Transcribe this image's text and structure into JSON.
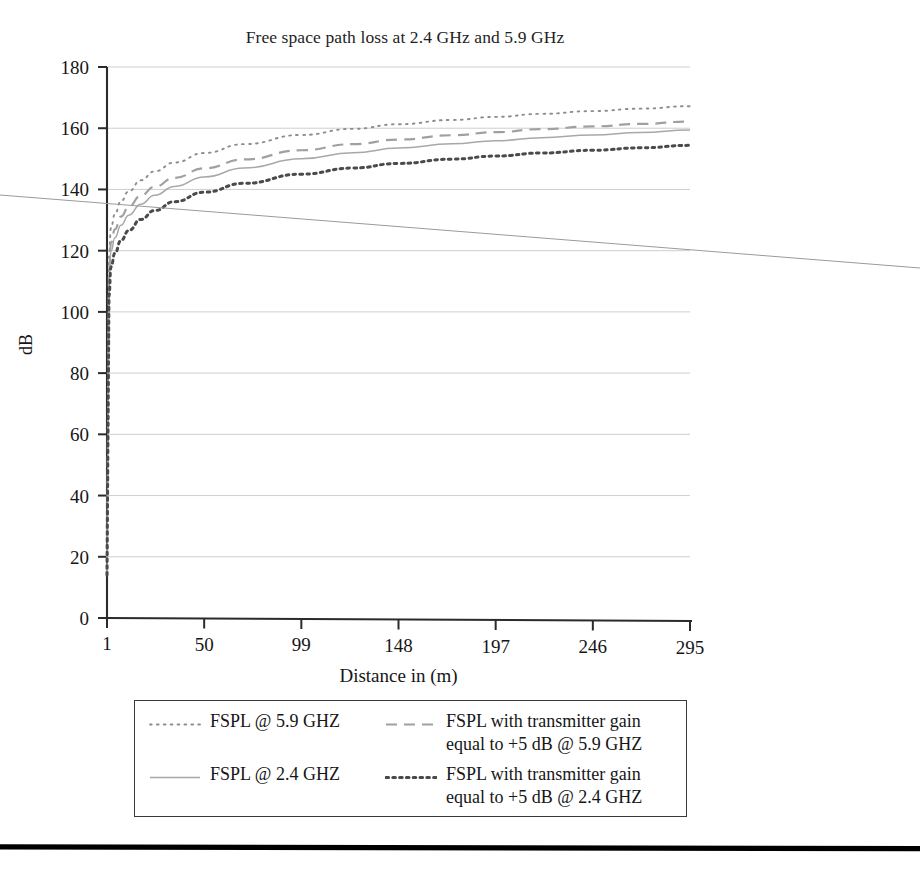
{
  "chart_data": {
    "type": "line",
    "title": "Free space path loss at 2.4 GHz and 5.9 GHz",
    "xlabel": "Distance in (m)",
    "ylabel": "dB",
    "xlim": [
      1,
      295
    ],
    "ylim": [
      0,
      180
    ],
    "grid": true,
    "legend_position": "below-plot",
    "xticks": [
      1,
      50,
      99,
      148,
      197,
      246,
      295
    ],
    "xtick_labels": [
      "1",
      "50",
      "99",
      "148",
      "197",
      "246",
      "295"
    ],
    "yticks": [
      0,
      20,
      40,
      60,
      80,
      100,
      120,
      140,
      160,
      180
    ],
    "ytick_labels": [
      "0",
      "20",
      "40",
      "60",
      "80",
      "100",
      "120",
      "140",
      "160",
      "180"
    ],
    "x": [
      1,
      2,
      3,
      5,
      8,
      12,
      18,
      25,
      35,
      50,
      70,
      99,
      125,
      148,
      175,
      197,
      220,
      246,
      270,
      295
    ],
    "series": [
      {
        "name": "FSPL @ 5.9 GHZ",
        "dash": "dotted",
        "color": "#8d8d8d",
        "values": [
          14.0,
          118.0,
          127.5,
          132.0,
          136.1,
          139.4,
          143.0,
          145.9,
          148.8,
          151.9,
          154.8,
          157.8,
          159.8,
          161.3,
          162.7,
          163.7,
          164.7,
          165.6,
          166.4,
          167.2
        ]
      },
      {
        "name": "FSPL with transmitter gain equal to +5 dB @ 5.9 GHZ",
        "dash": "dashed",
        "color": "#a0a0a0",
        "values": [
          14.0,
          113.0,
          122.5,
          127.0,
          131.1,
          134.4,
          138.0,
          140.9,
          143.8,
          146.9,
          149.8,
          152.8,
          154.8,
          156.3,
          157.7,
          158.7,
          159.7,
          160.6,
          161.4,
          162.2
        ]
      },
      {
        "name": "FSPL @ 2.4 GHZ",
        "dash": "solid",
        "color": "#a8a8a8",
        "values": [
          14.0,
          110.2,
          119.7,
          124.2,
          128.3,
          131.6,
          135.2,
          138.1,
          141.0,
          144.1,
          147.0,
          150.0,
          152.0,
          153.5,
          154.9,
          155.9,
          156.9,
          157.8,
          158.6,
          159.4
        ]
      },
      {
        "name": "FSPL with transmitter gain equal to +5 dB @ 2.4 GHZ",
        "dash": "bold-dotted",
        "color": "#4a4a4a",
        "values": [
          14.0,
          105.2,
          114.7,
          119.2,
          123.3,
          126.6,
          130.2,
          133.1,
          136.0,
          139.1,
          142.0,
          145.0,
          147.0,
          148.5,
          149.9,
          150.9,
          151.9,
          152.8,
          153.6,
          154.4
        ]
      }
    ]
  },
  "legend": {
    "entries": [
      {
        "label": "FSPL @ 5.9 GHZ",
        "dash": "dotted",
        "color": "#8d8d8d"
      },
      {
        "label": "FSPL with transmitter gain\nequal to +5 dB @ 5.9 GHZ",
        "dash": "dashed",
        "color": "#a0a0a0"
      },
      {
        "label": "FSPL @ 2.4 GHZ",
        "dash": "solid",
        "color": "#a8a8a8"
      },
      {
        "label": "FSPL with transmitter gain\nequal to +5 dB @ 2.4 GHZ",
        "dash": "bold-dotted",
        "color": "#4a4a4a"
      }
    ]
  },
  "colors": {
    "axis": "#2b2b2b",
    "grid": "#c9c9c9",
    "text": "#161616",
    "rule": "#000000"
  }
}
